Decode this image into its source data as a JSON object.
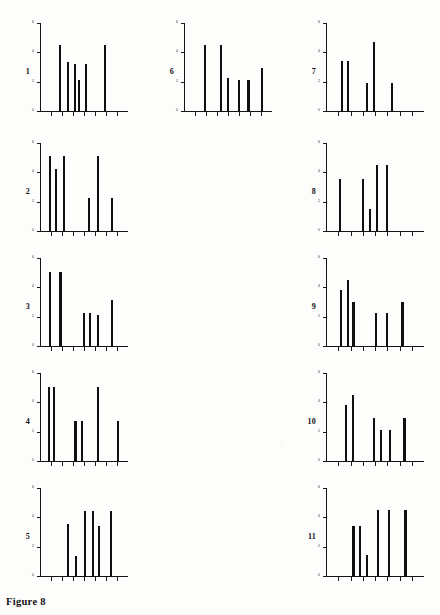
{
  "figure": {
    "caption": "Figure 8",
    "panel_count": 11
  },
  "chart_data": [
    {
      "type": "bar",
      "title": "1",
      "panel_label": "1",
      "xlabel": "",
      "ylabel": "",
      "grid": false,
      "legend": "none",
      "ylim": [
        0,
        6
      ],
      "yticks": [
        0,
        2,
        4,
        6
      ],
      "ytick_labels": [
        "0",
        "2",
        "4",
        "6"
      ],
      "categories": [
        "1",
        "2",
        "3",
        "4",
        "5",
        "6"
      ],
      "x": [
        0.2,
        0.29,
        0.37,
        0.42,
        0.5,
        0.72
      ],
      "values": [
        4.6,
        3.4,
        3.3,
        2.2,
        3.3,
        4.6
      ]
    },
    {
      "type": "bar",
      "title": "2",
      "panel_label": "2",
      "xlabel": "",
      "ylabel": "",
      "grid": false,
      "legend": "none",
      "ylim": [
        0,
        6
      ],
      "yticks": [
        0,
        2,
        4,
        6
      ],
      "ytick_labels": [
        "0",
        "2",
        "4",
        "6"
      ],
      "categories": [
        "1",
        "2",
        "3",
        "4",
        "5",
        "6"
      ],
      "x": [
        0.09,
        0.16,
        0.25,
        0.53,
        0.64,
        0.8
      ],
      "values": [
        5.2,
        4.3,
        5.2,
        2.3,
        5.2,
        2.3
      ]
    },
    {
      "type": "bar",
      "title": "3",
      "panel_label": "3",
      "xlabel": "",
      "ylabel": "",
      "grid": false,
      "legend": "none",
      "ylim": [
        0,
        6
      ],
      "yticks": [
        0,
        2,
        4,
        6
      ],
      "ytick_labels": [
        "0",
        "2",
        "4",
        "6"
      ],
      "categories": [
        "1",
        "2",
        "3",
        "4",
        "5",
        "6"
      ],
      "x": [
        0.09,
        0.21,
        0.48,
        0.55,
        0.64,
        0.8
      ],
      "values": [
        5.1,
        5.1,
        2.3,
        2.3,
        2.2,
        3.2
      ]
    },
    {
      "type": "bar",
      "title": "4",
      "panel_label": "4",
      "xlabel": "",
      "ylabel": "",
      "grid": false,
      "legend": "none",
      "ylim": [
        0,
        6
      ],
      "yticks": [
        0,
        2,
        4,
        6
      ],
      "ytick_labels": [
        "0",
        "2",
        "4",
        "6"
      ],
      "categories": [
        "1",
        "2",
        "3",
        "4",
        "5",
        "6"
      ],
      "x": [
        0.08,
        0.14,
        0.38,
        0.45,
        0.64,
        0.86
      ],
      "values": [
        5.1,
        5.1,
        2.8,
        2.8,
        5.1,
        2.8
      ]
    },
    {
      "type": "bar",
      "title": "5",
      "panel_label": "5",
      "xlabel": "",
      "ylabel": "",
      "grid": false,
      "legend": "none",
      "ylim": [
        0,
        6
      ],
      "yticks": [
        0,
        2,
        4,
        6
      ],
      "ytick_labels": [
        "0",
        "2",
        "4",
        "6"
      ],
      "categories": [
        "1",
        "2",
        "3",
        "4",
        "5",
        "6"
      ],
      "x": [
        0.3,
        0.39,
        0.49,
        0.58,
        0.65,
        0.78
      ],
      "values": [
        3.6,
        1.4,
        4.5,
        4.5,
        3.5,
        4.5
      ]
    },
    {
      "type": "bar",
      "title": "6",
      "panel_label": "6",
      "xlabel": "",
      "ylabel": "",
      "grid": false,
      "legend": "none",
      "ylim": [
        0,
        6
      ],
      "yticks": [
        0,
        2,
        4,
        6
      ],
      "ytick_labels": [
        "0",
        "2",
        "4",
        "6"
      ],
      "categories": [
        "1",
        "2",
        "3",
        "4",
        "5",
        "6"
      ],
      "x": [
        0.22,
        0.4,
        0.48,
        0.6,
        0.71,
        0.86
      ],
      "values": [
        4.6,
        4.6,
        2.3,
        2.2,
        2.2,
        3.0
      ]
    },
    {
      "type": "bar",
      "title": "7",
      "panel_label": "7",
      "xlabel": "",
      "ylabel": "",
      "grid": false,
      "legend": "none",
      "ylim": [
        0,
        6
      ],
      "yticks": [
        0,
        2,
        4,
        6
      ],
      "ytick_labels": [
        "0",
        "2",
        "4",
        "6"
      ],
      "categories": [
        "1",
        "2",
        "3",
        "4",
        "5"
      ],
      "x": [
        0.14,
        0.2,
        0.4,
        0.47,
        0.65
      ],
      "values": [
        3.5,
        3.5,
        2.0,
        4.8,
        2.0
      ]
    },
    {
      "type": "bar",
      "title": "8",
      "panel_label": "8",
      "xlabel": "",
      "ylabel": "",
      "grid": false,
      "legend": "none",
      "ylim": [
        0,
        6
      ],
      "yticks": [
        0,
        2,
        4,
        6
      ],
      "ytick_labels": [
        "0",
        "2",
        "4",
        "6"
      ],
      "categories": [
        "1",
        "2",
        "3",
        "4",
        "5"
      ],
      "x": [
        0.12,
        0.36,
        0.43,
        0.5,
        0.6
      ],
      "values": [
        3.6,
        3.6,
        1.6,
        4.6,
        4.6
      ]
    },
    {
      "type": "bar",
      "title": "9",
      "panel_label": "9",
      "xlabel": "",
      "ylabel": "",
      "grid": false,
      "legend": "none",
      "ylim": [
        0,
        6
      ],
      "yticks": [
        0,
        2,
        4,
        6
      ],
      "ytick_labels": [
        "0",
        "2",
        "4",
        "6"
      ],
      "categories": [
        "1",
        "2",
        "3",
        "4",
        "5",
        "6"
      ],
      "x": [
        0.13,
        0.2,
        0.26,
        0.49,
        0.6,
        0.76
      ],
      "values": [
        3.9,
        4.6,
        3.1,
        2.3,
        2.3,
        3.1
      ]
    },
    {
      "type": "bar",
      "title": "10",
      "panel_label": "10",
      "xlabel": "",
      "ylabel": "",
      "grid": false,
      "legend": "none",
      "ylim": [
        0,
        6
      ],
      "yticks": [
        0,
        2,
        4,
        6
      ],
      "ytick_labels": [
        "0",
        "2",
        "4",
        "6"
      ],
      "categories": [
        "1",
        "2",
        "3",
        "4",
        "5",
        "6"
      ],
      "x": [
        0.18,
        0.25,
        0.47,
        0.54,
        0.63,
        0.78
      ],
      "values": [
        3.9,
        4.6,
        3.0,
        2.2,
        2.2,
        3.0
      ]
    },
    {
      "type": "bar",
      "title": "11",
      "panel_label": "11",
      "xlabel": "",
      "ylabel": "",
      "grid": false,
      "legend": "none",
      "ylim": [
        0,
        6
      ],
      "yticks": [
        0,
        2,
        4,
        6
      ],
      "ytick_labels": [
        "0",
        "2",
        "4",
        "6"
      ],
      "categories": [
        "1",
        "2",
        "3",
        "4",
        "5",
        "6"
      ],
      "x": [
        0.26,
        0.33,
        0.4,
        0.51,
        0.62,
        0.79
      ],
      "values": [
        3.5,
        3.5,
        1.5,
        4.6,
        4.6,
        4.6
      ]
    }
  ],
  "layout": {
    "panels": [
      {
        "idx": 0,
        "left": 16,
        "top": 22,
        "width": 114,
        "height": 100
      },
      {
        "idx": 1,
        "left": 16,
        "top": 142,
        "width": 114,
        "height": 100
      },
      {
        "idx": 2,
        "left": 16,
        "top": 257,
        "width": 114,
        "height": 100
      },
      {
        "idx": 3,
        "left": 16,
        "top": 372,
        "width": 114,
        "height": 100
      },
      {
        "idx": 4,
        "left": 16,
        "top": 487,
        "width": 114,
        "height": 100
      },
      {
        "idx": 5,
        "left": 160,
        "top": 22,
        "width": 114,
        "height": 100
      },
      {
        "idx": 6,
        "left": 302,
        "top": 22,
        "width": 124,
        "height": 100
      },
      {
        "idx": 7,
        "left": 302,
        "top": 142,
        "width": 124,
        "height": 100
      },
      {
        "idx": 8,
        "left": 302,
        "top": 257,
        "width": 124,
        "height": 100
      },
      {
        "idx": 9,
        "left": 302,
        "top": 372,
        "width": 124,
        "height": 100
      },
      {
        "idx": 10,
        "left": 302,
        "top": 487,
        "width": 124,
        "height": 100
      }
    ]
  },
  "colors": {
    "ink": "#101010",
    "paper": "#fdfdfc",
    "axis": "#141414"
  }
}
